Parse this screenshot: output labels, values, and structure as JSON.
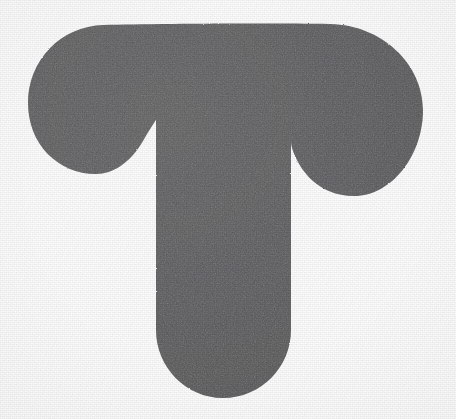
{
  "image": {
    "type": "glyph-silhouette",
    "subject": "letter-T",
    "character": "T",
    "description": "Bold rounded capital letter T silhouette",
    "alt_text": "A thick dark gray letter T with rounded arm ends and a rounded stem foot on a white background",
    "width": 456,
    "height": 419,
    "background_color": "#fdfdfd",
    "fill_color": "#58585a",
    "texture": "paper-grain",
    "style": "solid-filled, sans-serif, heavy-weight, rounded terminals"
  },
  "geometry": {
    "crossbar": {
      "top_y": 24,
      "left_x": 28,
      "right_x": 423,
      "left_lobe_bottom_y": 174,
      "right_lobe_bottom_y": 196,
      "left_lobe_center_x": 103,
      "right_lobe_center_x": 355
    },
    "stem": {
      "left_x": 156,
      "right_x": 291,
      "top_y": 24,
      "bottom_y": 398,
      "foot_radius": 68,
      "width": 135
    },
    "notches": {
      "left_cusp_x": 161,
      "left_cusp_y": 114,
      "right_cusp_x": 292,
      "right_cusp_y": 126
    },
    "path": "M 156 120 C 156 120 151 127 143 141 C 130 163 113 174 96 174 C 58 174 28 144 28 103 C 28 61 60 26 104 25 C 150 24 260 23 330 24 C 382 25 423 64 423 110 C 423 155 392 196 354 196 C 318 196 299 170 292 148 C 290 140 291 128 291 126 L 291 330 C 291 367 261 398 223 398 C 186 398 156 367 156 330 Z"
  },
  "palette": {
    "ink": "#58585a",
    "ink_dark": "#4e4e50",
    "ink_light": "#636365",
    "paper": "#fdfdfd"
  }
}
